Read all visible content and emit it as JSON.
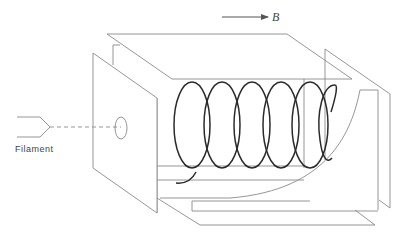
{
  "diagram": {
    "type": "apparatus-schematic",
    "labels": {
      "filament": "Filament",
      "field": "B"
    },
    "colors": {
      "background": "#ffffff",
      "plate_stroke": "#8a8a8a",
      "helix_stroke": "#2a2a2a",
      "arrow": "#555555",
      "text": "#444444"
    },
    "components": [
      {
        "id": "filament",
        "label": "Filament",
        "shape": "Y-shaped electrode"
      },
      {
        "id": "beam-path",
        "shape": "dashed line",
        "from": "filament",
        "to": "aperture"
      },
      {
        "id": "front-plate",
        "shape": "parallelogram plate with aperture"
      },
      {
        "id": "aperture",
        "shape": "ellipse"
      },
      {
        "id": "top-plate",
        "shape": "parallelogram"
      },
      {
        "id": "inner-box",
        "shape": "rectangular chamber"
      },
      {
        "id": "helix",
        "shape": "helical electron trajectory",
        "turns": 6
      },
      {
        "id": "collector",
        "shape": "curved collector plate"
      },
      {
        "id": "right-plates",
        "shape": "side plates"
      },
      {
        "id": "bottom-plates",
        "shape": "parallelogram plates"
      },
      {
        "id": "field-arrow",
        "label": "B",
        "direction": "right"
      }
    ]
  }
}
